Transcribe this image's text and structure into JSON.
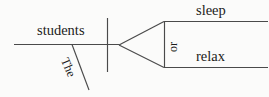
{
  "diagram": {
    "type": "reed-kellogg-sentence-diagram",
    "sentence": "The students sleep or relax.",
    "canvas": {
      "width": 269,
      "height": 97,
      "background": "#fbfbfa"
    },
    "ink_color": "#4a4a4a",
    "text_color": "#1b1b1b",
    "labels": {
      "subject": "students",
      "article": "The",
      "conjunction": "or",
      "predicate_1": "sleep",
      "predicate_2": "relax"
    },
    "strokes": {
      "baseline": "main horizontal baseline",
      "subject_verb_divider": "vertical bar crossing baseline",
      "modifier_slant": "slanted line for article The",
      "fork_upper": "branch to upper predicate",
      "fork_lower": "branch to lower predicate",
      "conjunction_connector": "vertical dashed-style connector between predicates",
      "predicate_line_upper": "horizontal line under sleep",
      "predicate_line_lower": "horizontal line under relax"
    }
  }
}
